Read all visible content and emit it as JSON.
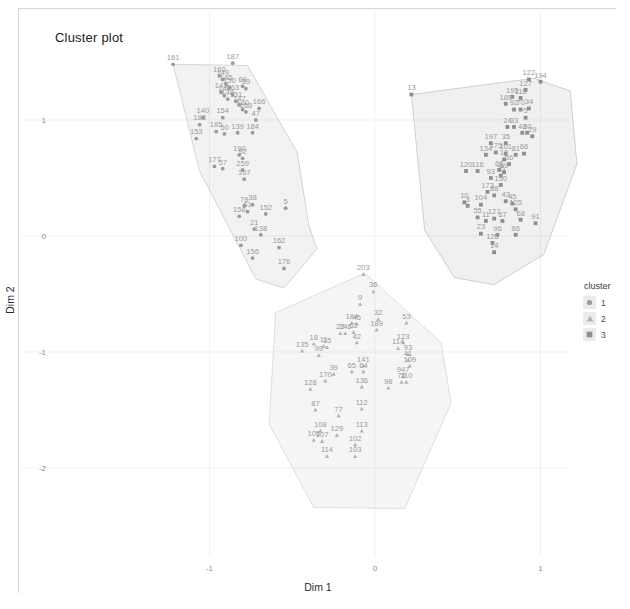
{
  "title": "Cluster plot",
  "axes": {
    "xlabel": "Dim 1",
    "ylabel": "Dim 2",
    "xticks": [
      "-1",
      "0",
      "1"
    ],
    "yticks": [
      "1",
      "0",
      "-1",
      "-2"
    ]
  },
  "legend": {
    "title": "cluster",
    "items": [
      {
        "label": "1",
        "shape": "circle",
        "color": "#9a9a9a"
      },
      {
        "label": "2",
        "shape": "triangle",
        "color": "#b4b4b4"
      },
      {
        "label": "3",
        "shape": "square",
        "color": "#8e8e8e"
      }
    ]
  },
  "chart_data": {
    "type": "scatter",
    "title": "Cluster plot",
    "xlabel": "Dim 1",
    "ylabel": "Dim 2",
    "xticks": [
      -1,
      0,
      1
    ],
    "yticks": [
      1,
      0,
      -1,
      -2
    ],
    "xlim": [
      -1.55,
      1.25
    ],
    "ylim": [
      -2.45,
      1.55
    ],
    "grid": true,
    "legend_title": "cluster",
    "legend_position": "right",
    "series": [
      {
        "name": "1",
        "shape": "circle",
        "color": "#9a9a9a",
        "hull": [
          [
            -1.22,
            1.48
          ],
          [
            -0.77,
            1.47
          ],
          [
            -0.47,
            0.72
          ],
          [
            -0.4,
            0.09
          ],
          [
            -0.35,
            -0.11
          ],
          [
            -0.55,
            -0.45
          ],
          [
            -0.72,
            -0.37
          ],
          [
            -1.06,
            0.56
          ]
        ],
        "points": [
          {
            "id": "161",
            "x": -1.22,
            "y": 1.48
          },
          {
            "id": "187",
            "x": -0.86,
            "y": 1.49
          },
          {
            "id": "160",
            "x": -0.94,
            "y": 1.38
          },
          {
            "id": "149",
            "x": -0.92,
            "y": 1.35
          },
          {
            "id": "145",
            "x": -0.9,
            "y": 1.31
          },
          {
            "id": "150",
            "x": -0.88,
            "y": 1.28
          },
          {
            "id": "69",
            "x": -0.8,
            "y": 1.29
          },
          {
            "id": "59",
            "x": -0.78,
            "y": 1.27
          },
          {
            "id": "143",
            "x": -0.93,
            "y": 1.24
          },
          {
            "id": "144",
            "x": -0.91,
            "y": 1.21
          },
          {
            "id": "163",
            "x": -0.86,
            "y": 1.22
          },
          {
            "id": "148",
            "x": -0.89,
            "y": 1.18
          },
          {
            "id": "131",
            "x": -0.84,
            "y": 1.16
          },
          {
            "id": "147",
            "x": -0.82,
            "y": 1.13
          },
          {
            "id": "166",
            "x": -0.7,
            "y": 1.1
          },
          {
            "id": "180",
            "x": -0.8,
            "y": 1.09
          },
          {
            "id": "168",
            "x": -0.78,
            "y": 1.07
          },
          {
            "id": "140",
            "x": -1.04,
            "y": 1.02
          },
          {
            "id": "154",
            "x": -0.92,
            "y": 1.02
          },
          {
            "id": "47",
            "x": -0.72,
            "y": 1.0
          },
          {
            "id": "188",
            "x": -1.06,
            "y": 0.96
          },
          {
            "id": "185",
            "x": -0.96,
            "y": 0.9
          },
          {
            "id": "50",
            "x": -0.91,
            "y": 0.88
          },
          {
            "id": "139",
            "x": -0.83,
            "y": 0.89
          },
          {
            "id": "184",
            "x": -0.74,
            "y": 0.89
          },
          {
            "id": "153",
            "x": -1.08,
            "y": 0.84
          },
          {
            "id": "190",
            "x": -0.82,
            "y": 0.7
          },
          {
            "id": "92",
            "x": -0.8,
            "y": 0.67
          },
          {
            "id": "177",
            "x": -0.97,
            "y": 0.6
          },
          {
            "id": "57",
            "x": -0.92,
            "y": 0.58
          },
          {
            "id": "259",
            "x": -0.8,
            "y": 0.57
          },
          {
            "id": "167",
            "x": -0.79,
            "y": 0.49
          },
          {
            "id": "78",
            "x": -0.79,
            "y": 0.26
          },
          {
            "id": "38",
            "x": -0.74,
            "y": 0.27
          },
          {
            "id": "61",
            "x": -0.77,
            "y": 0.21
          },
          {
            "id": "158",
            "x": -0.82,
            "y": 0.17
          },
          {
            "id": "152",
            "x": -0.66,
            "y": 0.19
          },
          {
            "id": "5",
            "x": -0.54,
            "y": 0.24
          },
          {
            "id": "21",
            "x": -0.73,
            "y": 0.06
          },
          {
            "id": "138",
            "x": -0.69,
            "y": 0.01
          },
          {
            "id": "100",
            "x": -0.81,
            "y": -0.08
          },
          {
            "id": "162",
            "x": -0.58,
            "y": -0.1
          },
          {
            "id": "156",
            "x": -0.74,
            "y": -0.19
          },
          {
            "id": "176",
            "x": -0.55,
            "y": -0.28
          }
        ]
      },
      {
        "name": "2",
        "shape": "triangle",
        "color": "#b4b4b4",
        "hull": [
          [
            -0.06,
            -0.32
          ],
          [
            0.4,
            -0.92
          ],
          [
            0.46,
            -1.44
          ],
          [
            0.18,
            -2.35
          ],
          [
            -0.37,
            -2.34
          ],
          [
            -0.64,
            -1.62
          ],
          [
            -0.6,
            -0.66
          ]
        ],
        "points": [
          {
            "id": "203",
            "x": -0.07,
            "y": -0.33
          },
          {
            "id": "36",
            "x": -0.01,
            "y": -0.48
          },
          {
            "id": "9",
            "x": -0.09,
            "y": -0.59
          },
          {
            "id": "32",
            "x": 0.02,
            "y": -0.72
          },
          {
            "id": "184",
            "x": -0.14,
            "y": -0.75
          },
          {
            "id": "45",
            "x": -0.11,
            "y": -0.76
          },
          {
            "id": "189",
            "x": 0.01,
            "y": -0.81
          },
          {
            "id": "53",
            "x": 0.19,
            "y": -0.75
          },
          {
            "id": "23",
            "x": -0.21,
            "y": -0.84
          },
          {
            "id": "246",
            "x": -0.18,
            "y": -0.84
          },
          {
            "id": "62",
            "x": -0.13,
            "y": -0.83
          },
          {
            "id": "42",
            "x": -0.11,
            "y": -0.92
          },
          {
            "id": "18",
            "x": -0.37,
            "y": -0.93
          },
          {
            "id": "11",
            "x": -0.31,
            "y": -0.95
          },
          {
            "id": "15",
            "x": -0.29,
            "y": -0.96
          },
          {
            "id": "123",
            "x": 0.17,
            "y": -0.92
          },
          {
            "id": "114",
            "x": 0.14,
            "y": -0.97
          },
          {
            "id": "135",
            "x": -0.44,
            "y": -0.99
          },
          {
            "id": "99",
            "x": -0.34,
            "y": -1.03
          },
          {
            "id": "93",
            "x": 0.2,
            "y": -1.02
          },
          {
            "id": "41",
            "x": 0.2,
            "y": -1.07
          },
          {
            "id": "141",
            "x": -0.07,
            "y": -1.12
          },
          {
            "id": "65",
            "x": -0.14,
            "y": -1.17
          },
          {
            "id": "64",
            "x": -0.07,
            "y": -1.17
          },
          {
            "id": "39",
            "x": -0.25,
            "y": -1.19
          },
          {
            "id": "109",
            "x": 0.21,
            "y": -1.12
          },
          {
            "id": "947",
            "x": 0.17,
            "y": -1.21
          },
          {
            "id": "72",
            "x": 0.16,
            "y": -1.26
          },
          {
            "id": "110",
            "x": 0.19,
            "y": -1.26
          },
          {
            "id": "170",
            "x": -0.3,
            "y": -1.25
          },
          {
            "id": "128",
            "x": -0.39,
            "y": -1.32
          },
          {
            "id": "136",
            "x": -0.08,
            "y": -1.3
          },
          {
            "id": "98",
            "x": 0.08,
            "y": -1.31
          },
          {
            "id": "87",
            "x": -0.36,
            "y": -1.5
          },
          {
            "id": "77",
            "x": -0.22,
            "y": -1.55
          },
          {
            "id": "112",
            "x": -0.08,
            "y": -1.49
          },
          {
            "id": "108",
            "x": -0.33,
            "y": -1.68
          },
          {
            "id": "129",
            "x": -0.23,
            "y": -1.72
          },
          {
            "id": "113",
            "x": -0.08,
            "y": -1.68
          },
          {
            "id": "105",
            "x": -0.37,
            "y": -1.76
          },
          {
            "id": "107",
            "x": -0.32,
            "y": -1.77
          },
          {
            "id": "102",
            "x": -0.12,
            "y": -1.8
          },
          {
            "id": "114b",
            "x": -0.29,
            "y": -1.9
          },
          {
            "id": "103",
            "x": -0.12,
            "y": -1.9
          }
        ]
      },
      {
        "name": "3",
        "shape": "square",
        "color": "#8e8e8e",
        "hull": [
          [
            0.22,
            1.22
          ],
          [
            0.96,
            1.36
          ],
          [
            1.18,
            1.25
          ],
          [
            1.22,
            0.62
          ],
          [
            1.02,
            -0.16
          ],
          [
            0.72,
            -0.42
          ],
          [
            0.48,
            -0.36
          ],
          [
            0.3,
            0.05
          ]
        ],
        "points": [
          {
            "id": "13",
            "x": 0.22,
            "y": 1.22
          },
          {
            "id": "122",
            "x": 0.93,
            "y": 1.35
          },
          {
            "id": "194",
            "x": 1.0,
            "y": 1.33
          },
          {
            "id": "127",
            "x": 0.91,
            "y": 1.26
          },
          {
            "id": "195",
            "x": 0.83,
            "y": 1.2
          },
          {
            "id": "118",
            "x": 0.88,
            "y": 1.19
          },
          {
            "id": "189",
            "x": 0.79,
            "y": 1.14
          },
          {
            "id": "92",
            "x": 0.84,
            "y": 1.09
          },
          {
            "id": "70",
            "x": 0.88,
            "y": 1.09
          },
          {
            "id": "34",
            "x": 0.93,
            "y": 1.1
          },
          {
            "id": "5b",
            "x": 0.91,
            "y": 1.02
          },
          {
            "id": "24",
            "x": 0.8,
            "y": 0.94
          },
          {
            "id": "33",
            "x": 0.84,
            "y": 0.94
          },
          {
            "id": "48",
            "x": 0.89,
            "y": 0.89
          },
          {
            "id": "30",
            "x": 0.92,
            "y": 0.89
          },
          {
            "id": "29",
            "x": 0.95,
            "y": 0.86
          },
          {
            "id": "197",
            "x": 0.7,
            "y": 0.8
          },
          {
            "id": "35",
            "x": 0.79,
            "y": 0.8
          },
          {
            "id": "175",
            "x": 0.73,
            "y": 0.72
          },
          {
            "id": "101",
            "x": 0.79,
            "y": 0.71
          },
          {
            "id": "81",
            "x": 0.85,
            "y": 0.7
          },
          {
            "id": "66",
            "x": 0.9,
            "y": 0.71
          },
          {
            "id": "134",
            "x": 0.67,
            "y": 0.7
          },
          {
            "id": "12",
            "x": 0.78,
            "y": 0.66
          },
          {
            "id": "56",
            "x": 0.81,
            "y": 0.62
          },
          {
            "id": "120",
            "x": 0.55,
            "y": 0.56
          },
          {
            "id": "116",
            "x": 0.62,
            "y": 0.56
          },
          {
            "id": "66b",
            "x": 0.75,
            "y": 0.57
          },
          {
            "id": "69",
            "x": 0.78,
            "y": 0.55
          },
          {
            "id": "75",
            "x": 0.76,
            "y": 0.52
          },
          {
            "id": "93",
            "x": 0.7,
            "y": 0.5
          },
          {
            "id": "130",
            "x": 0.76,
            "y": 0.44
          },
          {
            "id": "173",
            "x": 0.68,
            "y": 0.38
          },
          {
            "id": "88",
            "x": 0.72,
            "y": 0.35
          },
          {
            "id": "10",
            "x": 0.54,
            "y": 0.29
          },
          {
            "id": "43",
            "x": 0.79,
            "y": 0.3
          },
          {
            "id": "104",
            "x": 0.64,
            "y": 0.27
          },
          {
            "id": "3",
            "x": 0.56,
            "y": 0.26
          },
          {
            "id": "45",
            "x": 0.83,
            "y": 0.28
          },
          {
            "id": "125",
            "x": 0.85,
            "y": 0.23
          },
          {
            "id": "55",
            "x": 0.62,
            "y": 0.16
          },
          {
            "id": "127b",
            "x": 0.72,
            "y": 0.15
          },
          {
            "id": "11",
            "x": 0.67,
            "y": 0.13
          },
          {
            "id": "67",
            "x": 0.77,
            "y": 0.13
          },
          {
            "id": "68",
            "x": 0.88,
            "y": 0.14
          },
          {
            "id": "91",
            "x": 0.97,
            "y": 0.11
          },
          {
            "id": "23",
            "x": 0.64,
            "y": 0.02
          },
          {
            "id": "96",
            "x": 0.74,
            "y": 0.01
          },
          {
            "id": "86",
            "x": 0.85,
            "y": 0.01
          },
          {
            "id": "126",
            "x": 0.71,
            "y": -0.06
          },
          {
            "id": "14",
            "x": 0.72,
            "y": -0.14
          }
        ]
      }
    ]
  }
}
